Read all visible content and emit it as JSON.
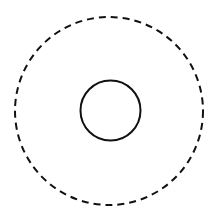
{
  "diagram": {
    "background": "#ffffff",
    "stroke_color": "#111111",
    "shapes": [
      {
        "type": "circle",
        "style": "dashed",
        "cx": 109,
        "cy": 111,
        "r": 94,
        "stroke_width": 2,
        "dash": "7 5"
      },
      {
        "type": "circle",
        "style": "solid",
        "cx": 110.5,
        "cy": 110.5,
        "r": 30,
        "stroke_width": 2
      }
    ]
  }
}
